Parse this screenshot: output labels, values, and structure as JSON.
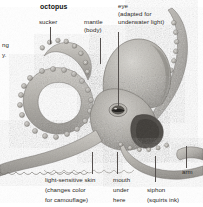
{
  "figure": {
    "title": "octopus",
    "subject": "octopus",
    "style": "grayscale engraved illustration with callout labels",
    "background_color": "#ffffff",
    "text_color": "#2b2725",
    "leader_line_color": "#55504e"
  },
  "clipped_text": {
    "line1": "ng",
    "line2": "y."
  },
  "labels": {
    "sucker": "sucker",
    "mantle_line1": "mantle",
    "mantle_line2": "(body)",
    "eye_line1": "eye",
    "eye_line2": "(adapted for",
    "eye_line3": "underwater light)",
    "skin_line1": "light-sensitive skin",
    "skin_line2": "(changes color",
    "skin_line3": "for camouflage)",
    "mouth_line1": "mouth",
    "mouth_line2": "under",
    "mouth_line3": "here",
    "siphon_line1": "siphon",
    "siphon_line2": "(squirts ink)",
    "arm": "arm"
  }
}
